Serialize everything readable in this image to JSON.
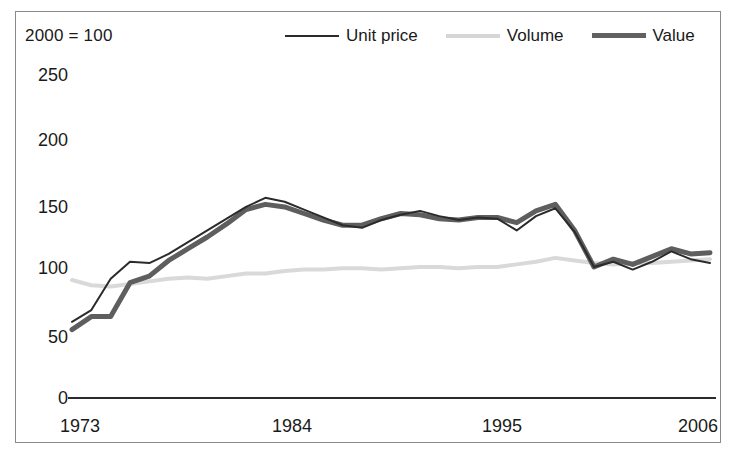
{
  "title_partial": "",
  "base_note": "2000 = 100",
  "legend": {
    "items": [
      {
        "label": "Unit price",
        "color": "#2b2b2b"
      },
      {
        "label": "Volume",
        "color": "#d9d9d9"
      },
      {
        "label": "Value",
        "color": "#5e5e5e"
      }
    ]
  },
  "axis": {
    "y_ticks": [
      "250",
      "200",
      "150",
      "100",
      "50",
      "0"
    ],
    "x_ticks": [
      "1973",
      "1984",
      "1995",
      "2006"
    ]
  },
  "chart_data": {
    "type": "line",
    "title": "",
    "subtitle": "2000 = 100",
    "xlabel": "",
    "ylabel": "",
    "ylim": [
      0,
      250
    ],
    "yticks": [
      0,
      50,
      100,
      150,
      200,
      250
    ],
    "xlim": [
      1973,
      2006
    ],
    "xticks": [
      1973,
      1984,
      1995,
      2006
    ],
    "grid": false,
    "legend_position": "top",
    "x": [
      1973,
      1974,
      1975,
      1976,
      1977,
      1978,
      1979,
      1980,
      1981,
      1982,
      1983,
      1984,
      1985,
      1986,
      1987,
      1988,
      1989,
      1990,
      1991,
      1992,
      1993,
      1994,
      1995,
      1996,
      1997,
      1998,
      1999,
      2000,
      2001,
      2002,
      2003,
      2004,
      2005,
      2006
    ],
    "series": [
      {
        "name": "Unit price",
        "color": "#2b2b2b",
        "width": 2,
        "values": [
          58,
          67,
          91,
          104,
          103,
          110,
          119,
          128,
          137,
          146,
          153,
          150,
          144,
          138,
          132,
          130,
          136,
          140,
          143,
          139,
          136,
          138,
          137,
          128,
          139,
          145,
          127,
          100,
          104,
          98,
          104,
          112,
          106,
          103
        ]
      },
      {
        "name": "Volume",
        "color": "#d9d9d9",
        "width": 4,
        "values": [
          90,
          86,
          85,
          87,
          89,
          91,
          92,
          91,
          93,
          95,
          95,
          97,
          98,
          98,
          99,
          99,
          98,
          99,
          100,
          100,
          99,
          100,
          100,
          102,
          104,
          107,
          105,
          103,
          102,
          103,
          103,
          104,
          105,
          106
        ]
      },
      {
        "name": "Value",
        "color": "#5e5e5e",
        "width": 5,
        "values": [
          52,
          62,
          62,
          88,
          93,
          105,
          114,
          123,
          133,
          144,
          148,
          146,
          141,
          136,
          132,
          132,
          137,
          141,
          140,
          137,
          136,
          138,
          138,
          134,
          143,
          148,
          128,
          100,
          106,
          102,
          108,
          114,
          110,
          111
        ]
      }
    ]
  }
}
